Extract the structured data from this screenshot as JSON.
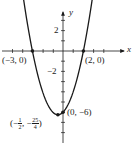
{
  "chart_data": {
    "type": "line",
    "title": "",
    "function": "y = x^2 + x - 6",
    "xlabel": "x",
    "ylabel": "y",
    "xlim": [
      -6,
      6.5
    ],
    "ylim": [
      -8.5,
      5
    ],
    "x_ticks_step": 1,
    "y_ticks_step": 1,
    "y_tick_labels": [
      "2",
      "−2"
    ],
    "grid": false,
    "legend": null,
    "series": [
      {
        "name": "parabola",
        "x": [
          -4.2,
          -3.5,
          -3,
          -2.5,
          -2,
          -1.5,
          -1,
          -0.5,
          0,
          0.5,
          1,
          1.5,
          2,
          2.5,
          3.2
        ],
        "values": [
          7.44,
          2.75,
          0,
          -2.25,
          -4,
          -5.25,
          -6,
          -6.25,
          -6,
          -5.25,
          -4,
          -2.25,
          0,
          2.75,
          7.44
        ]
      }
    ],
    "points": [
      {
        "label": "(−3, 0)",
        "x": -3,
        "y": 0
      },
      {
        "label": "(2, 0)",
        "x": 2,
        "y": 0
      },
      {
        "label": "(0, −6)",
        "x": 0,
        "y": -6
      },
      {
        "label": "(−1/2, −25/4)",
        "x": -0.5,
        "y": -6.25
      }
    ]
  },
  "labels": {
    "x_axis": "x",
    "y_axis": "y",
    "y_tick_pos": "2",
    "y_tick_neg": "−2",
    "root_left": "(−3, 0)",
    "root_right": "(2, 0)",
    "y_intercept": "(0, −6)",
    "vertex_open": "(−",
    "vertex_x_num": "1",
    "vertex_x_den": "2",
    "vertex_mid": ", −",
    "vertex_y_num": "25",
    "vertex_y_den": "4",
    "vertex_close": ")"
  }
}
